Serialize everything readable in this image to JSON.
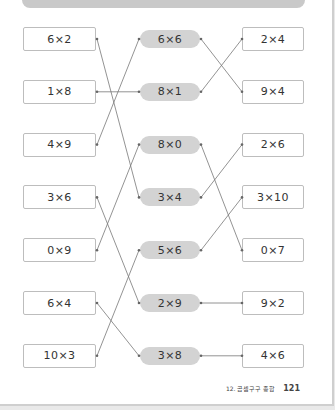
{
  "page": {
    "footer_chapter": "12. 곱셈구구 종합",
    "page_number": "121"
  },
  "left": [
    "6×2",
    "1×8",
    "4×9",
    "3×6",
    "0×9",
    "6×4",
    "10×3"
  ],
  "middle": [
    "6×6",
    "8×1",
    "8×0",
    "3×4",
    "5×6",
    "2×9",
    "3×8"
  ],
  "right": [
    "2×4",
    "9×4",
    "2×6",
    "3×10",
    "0×7",
    "9×2",
    "4×6"
  ],
  "connections_left_to_middle": [
    [
      1,
      4
    ],
    [
      2,
      2
    ],
    [
      3,
      1
    ],
    [
      4,
      6
    ],
    [
      5,
      3
    ],
    [
      6,
      7
    ],
    [
      7,
      5
    ]
  ],
  "connections_middle_to_right": [
    [
      1,
      2
    ],
    [
      2,
      1
    ],
    [
      3,
      5
    ],
    [
      4,
      3
    ],
    [
      5,
      4
    ],
    [
      6,
      6
    ],
    [
      7,
      7
    ]
  ],
  "colors": {
    "pill_bg": "#d3d3d3",
    "box_border": "#bdbdbd",
    "line": "#777777",
    "banner": "#c9c9c9"
  }
}
